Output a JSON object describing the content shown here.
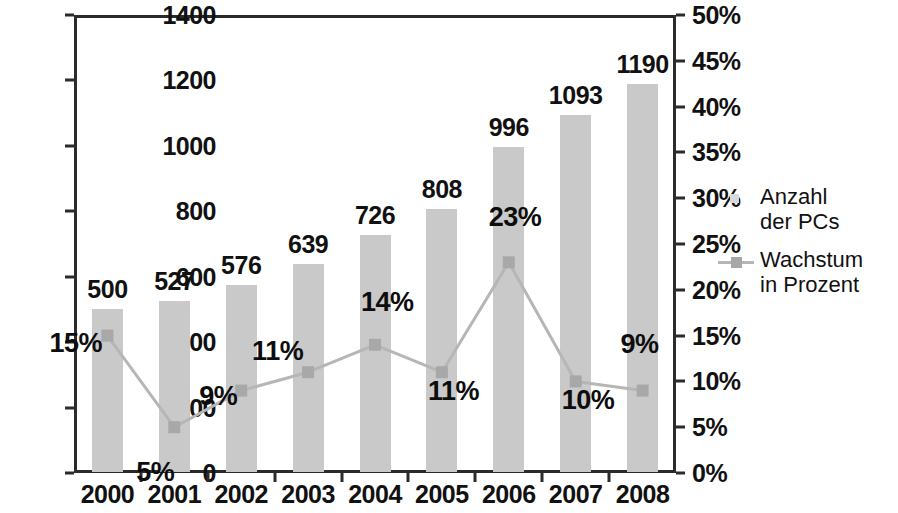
{
  "chart_data": {
    "type": "bar",
    "title": "",
    "subtitle": "",
    "xlabel": "",
    "ylabel": "",
    "categories": [
      "2000",
      "2001",
      "2002",
      "2003",
      "2004",
      "2005",
      "2006",
      "2007",
      "2008"
    ],
    "series": [
      {
        "name": "Anzahl\nder PCs",
        "type": "bar",
        "axis": "left",
        "values": [
          500,
          527,
          576,
          639,
          726,
          808,
          996,
          1093,
          1190
        ],
        "labels": [
          "500",
          "527",
          "576",
          "639",
          "726",
          "808",
          "996",
          "1093",
          "1190"
        ],
        "color": "#c9c9c9"
      },
      {
        "name": "Wachstum\nin Prozent",
        "type": "line",
        "axis": "right",
        "values": [
          15,
          5,
          9,
          11,
          14,
          11,
          23,
          10,
          9
        ],
        "labels": [
          "15%",
          "5%",
          "9%",
          "11%",
          "14%",
          "11%",
          "23%",
          "10%",
          "9%"
        ],
        "color": "#b6b6b6",
        "marker_color": "#a8a8a8"
      }
    ],
    "y_left": {
      "min": 0,
      "max": 1400,
      "step": 200,
      "ticks": [
        "0",
        "200",
        "400",
        "600",
        "800",
        "1000",
        "1200",
        "1400"
      ]
    },
    "y_right": {
      "min": 0,
      "max": 50,
      "step": 5,
      "ticks": [
        "0%",
        "5%",
        "10%",
        "15%",
        "20%",
        "25%",
        "30%",
        "35%",
        "40%",
        "45%",
        "50%"
      ]
    },
    "grid": false,
    "legend_position": "right",
    "frame": true
  },
  "legend": {
    "items": [
      {
        "label": "Anzahl\nder PCs",
        "key": "bar-swatch"
      },
      {
        "label": "Wachstum\nin Prozent",
        "key": "line-swatch"
      }
    ]
  },
  "colors": {
    "bar": "#c9c9c9",
    "line": "#b6b6b6",
    "marker": "#a8a8a8",
    "axis": "#2b2b2b",
    "text": "#111111",
    "background": "#ffffff"
  }
}
